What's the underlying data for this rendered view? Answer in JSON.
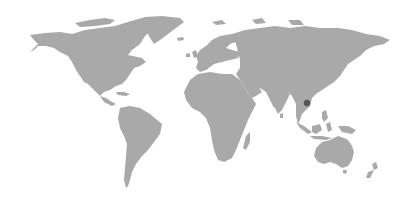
{
  "map": {
    "type": "world-choropleth",
    "projection": "miller",
    "background_color": "#ffffff",
    "land_color": "#a9a9a9",
    "highlight_color": "#555555",
    "highlighted_regions": [
      {
        "name": "Cambodia",
        "color": "#555555"
      }
    ]
  }
}
